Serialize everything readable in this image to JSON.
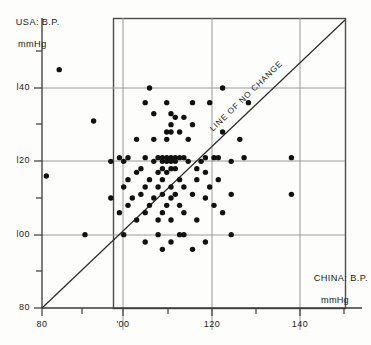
{
  "figure": {
    "name": "blood-pressure-scatter",
    "background": "#fdfdfb",
    "ink": "#1a1a1a",
    "grid_color": "#8d8d8d"
  },
  "chart_data": {
    "type": "scatter",
    "title": "",
    "xlabel": "CHINA: B.P. mmHg",
    "xlabel_line1": "CHINA: B.P.",
    "xlabel_line2": "mmHg",
    "ylabel": "USA: B.P. mmHg",
    "ylabel_line1": "USA: B.P.",
    "ylabel_line2": "mmHg",
    "xlim": [
      80,
      148
    ],
    "ylim": [
      80,
      156
    ],
    "xticks": [
      80,
      100,
      120,
      140
    ],
    "xtick_labels": [
      "80",
      "'00",
      "120",
      "140"
    ],
    "xticks_minor": [
      90,
      110,
      130
    ],
    "yticks": [
      80,
      100,
      120,
      140
    ],
    "ytick_labels": [
      "80",
      "l00",
      "l20",
      "l40"
    ],
    "yticks_minor": [
      90,
      110,
      130,
      150
    ],
    "grid": true,
    "grid_on_major": true,
    "legend": "none",
    "annotations": [
      {
        "text": "LINE OF NO CHANGE",
        "type": "rotated-label",
        "along": "identity-line",
        "x": 122,
        "y": 122
      }
    ],
    "reference_line": {
      "name": "line-of-no-change",
      "type": "identity",
      "from": [
        80,
        80
      ],
      "to": [
        148,
        148
      ],
      "label": "LINE OF NO CHANGE"
    },
    "series": [
      {
        "name": "subjects",
        "marker": "filled-circle",
        "color": "#111111",
        "points": [
          [
            84,
            145
          ],
          [
            105,
            140
          ],
          [
            122,
            140
          ],
          [
            104,
            136
          ],
          [
            109,
            136
          ],
          [
            115,
            136
          ],
          [
            119,
            136
          ],
          [
            128,
            136
          ],
          [
            106,
            133
          ],
          [
            110,
            133
          ],
          [
            111,
            132
          ],
          [
            113,
            132
          ],
          [
            92,
            131
          ],
          [
            110,
            130
          ],
          [
            115,
            130
          ],
          [
            109,
            128
          ],
          [
            110,
            128
          ],
          [
            112,
            128
          ],
          [
            122,
            128
          ],
          [
            102,
            126
          ],
          [
            106,
            126
          ],
          [
            109,
            126
          ],
          [
            114,
            126
          ],
          [
            126,
            126
          ],
          [
            81,
            116
          ],
          [
            98,
            121
          ],
          [
            100,
            121
          ],
          [
            104,
            121
          ],
          [
            107,
            121
          ],
          [
            108,
            121
          ],
          [
            109,
            121
          ],
          [
            110,
            121
          ],
          [
            111,
            121
          ],
          [
            112,
            121
          ],
          [
            113,
            121
          ],
          [
            118,
            121
          ],
          [
            120,
            121
          ],
          [
            121,
            121
          ],
          [
            127,
            121
          ],
          [
            138,
            121
          ],
          [
            96,
            120
          ],
          [
            99,
            120
          ],
          [
            106,
            120
          ],
          [
            108,
            120
          ],
          [
            109,
            120
          ],
          [
            110,
            120
          ],
          [
            111,
            120
          ],
          [
            114,
            120
          ],
          [
            117,
            120
          ],
          [
            124,
            120
          ],
          [
            103,
            118
          ],
          [
            108,
            118
          ],
          [
            110,
            118
          ],
          [
            111,
            118
          ],
          [
            116,
            118
          ],
          [
            102,
            117
          ],
          [
            107,
            117
          ],
          [
            109,
            117
          ],
          [
            118,
            117
          ],
          [
            100,
            115
          ],
          [
            105,
            115
          ],
          [
            108,
            115
          ],
          [
            112,
            115
          ],
          [
            116,
            115
          ],
          [
            121,
            115
          ],
          [
            99,
            113
          ],
          [
            104,
            113
          ],
          [
            107,
            113
          ],
          [
            110,
            113
          ],
          [
            113,
            113
          ],
          [
            119,
            113
          ],
          [
            103,
            111
          ],
          [
            108,
            111
          ],
          [
            111,
            111
          ],
          [
            115,
            111
          ],
          [
            124,
            111
          ],
          [
            138,
            111
          ],
          [
            96,
            110
          ],
          [
            101,
            110
          ],
          [
            106,
            110
          ],
          [
            110,
            110
          ],
          [
            118,
            110
          ],
          [
            100,
            108
          ],
          [
            105,
            108
          ],
          [
            109,
            108
          ],
          [
            112,
            108
          ],
          [
            120,
            108
          ],
          [
            98,
            106
          ],
          [
            104,
            106
          ],
          [
            108,
            106
          ],
          [
            113,
            106
          ],
          [
            122,
            106
          ],
          [
            102,
            104
          ],
          [
            107,
            104
          ],
          [
            110,
            104
          ],
          [
            116,
            104
          ],
          [
            90,
            100
          ],
          [
            99,
            100
          ],
          [
            107,
            100
          ],
          [
            112,
            100
          ],
          [
            113,
            100
          ],
          [
            124,
            100
          ],
          [
            104,
            98
          ],
          [
            110,
            98
          ],
          [
            118,
            98
          ],
          [
            108,
            96
          ],
          [
            115,
            96
          ]
        ]
      }
    ],
    "n_points": 108
  },
  "axes": {
    "x_axis_name": "china-bp-axis",
    "y_axis_name": "usa-bp-axis",
    "frame": "box"
  }
}
